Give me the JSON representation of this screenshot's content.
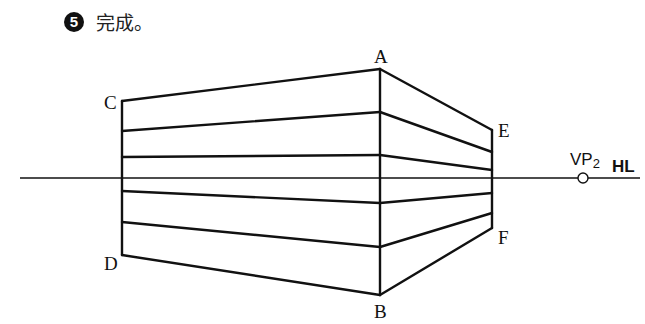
{
  "step": {
    "number": "5",
    "text": "完成。"
  },
  "diagram": {
    "labels": {
      "A": "A",
      "B": "B",
      "C": "C",
      "D": "D",
      "E": "E",
      "F": "F"
    },
    "vp": {
      "text": "VP",
      "sub": "2"
    },
    "horizon": "HL",
    "colors": {
      "line": "#111111",
      "background": "#ffffff"
    }
  }
}
